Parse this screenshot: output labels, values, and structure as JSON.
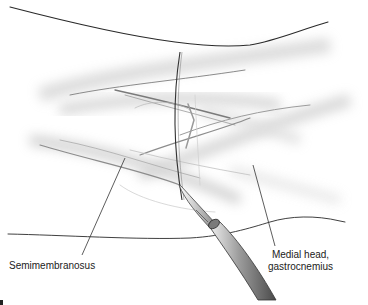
{
  "figure": {
    "type": "surgical-anatomy-illustration",
    "labels": {
      "semimembranosus": "Semimembranosus",
      "gastrocnemius_line1": "Medial head,",
      "gastrocnemius_line2": "gastrocnemius"
    },
    "instruments": [
      "scalpel"
    ],
    "colors": {
      "background": "#ffffff",
      "outline": "#222222",
      "shading": "#9a9a9a",
      "label_text": "#222222"
    }
  }
}
